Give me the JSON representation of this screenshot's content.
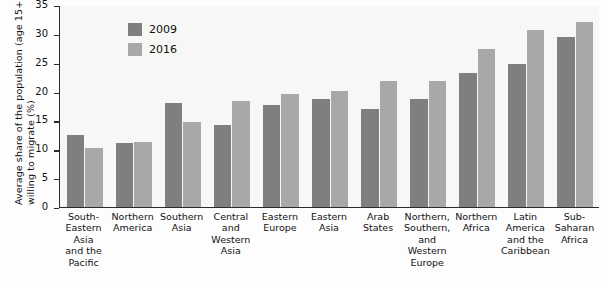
{
  "chart_data": {
    "type": "bar",
    "title": "",
    "xlabel": "",
    "ylabel": "Average share of the population (age 15+) willing to migrate (%)",
    "ylabel_lines": [
      "Average share of the population (age 15+)",
      "willing to migrate (%)"
    ],
    "ylim": [
      0,
      35
    ],
    "yticks": [
      0,
      5,
      10,
      15,
      20,
      25,
      30,
      35
    ],
    "ytick_labels": [
      "0",
      "5",
      "10",
      "15",
      "20",
      "25",
      "30",
      "35"
    ],
    "grid": false,
    "legend_position": "top-left inside plot",
    "categories": [
      "South-Eastern Asia and the Pacific",
      "Northern America",
      "Southern Asia",
      "Central and Western Asia",
      "Eastern Europe",
      "Eastern Asia",
      "Arab States",
      "Northern, Southern, and Western Europe",
      "Northern Africa",
      "Latin America and the Caribbean",
      "Sub-Saharan Africa"
    ],
    "category_lines": [
      [
        "South-",
        "Eastern",
        "Asia",
        "and the",
        "Pacific"
      ],
      [
        "Northern",
        "America"
      ],
      [
        "Southern",
        "Asia"
      ],
      [
        "Central",
        "and",
        "Western",
        "Asia"
      ],
      [
        "Eastern",
        "Europe"
      ],
      [
        "Eastern",
        "Asia"
      ],
      [
        "Arab",
        "States"
      ],
      [
        "Northern,",
        "Southern,",
        "and",
        "Western",
        "Europe"
      ],
      [
        "Northern",
        "Africa"
      ],
      [
        "Latin",
        "America",
        "and the",
        "Caribbean"
      ],
      [
        "Sub-",
        "Saharan",
        "Africa"
      ]
    ],
    "series": [
      {
        "name": "2009",
        "color": "#7f7f7f",
        "values": [
          12.5,
          11.1,
          18.0,
          14.2,
          17.7,
          18.8,
          17.0,
          18.8,
          23.3,
          24.8,
          29.5
        ]
      },
      {
        "name": "2016",
        "color": "#a8a8a6",
        "values": [
          10.2,
          11.2,
          14.7,
          18.3,
          19.6,
          20.1,
          21.9,
          21.8,
          27.4,
          30.7,
          32.0
        ]
      }
    ]
  },
  "legend": {
    "items": [
      {
        "label": "2009",
        "swatch_class": "s2009"
      },
      {
        "label": "2016",
        "swatch_class": "s2016"
      }
    ]
  }
}
